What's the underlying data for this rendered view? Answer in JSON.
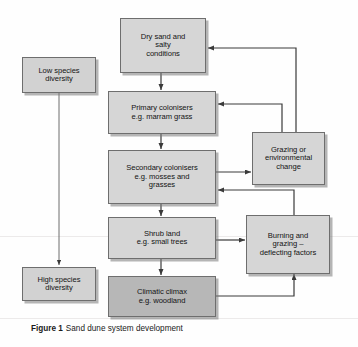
{
  "figure": {
    "caption_label": "Figure 1",
    "caption_text": "Sand dune system development",
    "colors": {
      "node_fill": "#d6d6d6",
      "node_fill_dark": "#b7b7b7",
      "node_border": "#6e6e6e",
      "arrow": "#3a3a3a",
      "background": "#fefefe"
    }
  },
  "nodes": {
    "dry_sand": "Dry sand and\nsalty\nconditions",
    "primary_colonisers": "Primary colonisers\ne.g. marram grass",
    "secondary_colonisers": "Secondary colonisers\ne.g. mosses and\ngrasses",
    "shrub_land": "Shrub land\ne.g. small trees",
    "climatic_climax": "Climatic climax\ne.g. woodland",
    "grazing_change": "Grazing or\nenvironmental\nchange",
    "burning_grazing": "Burning and\ngrazing –\ndeflecting factors",
    "low_diversity": "Low species\ndiversity",
    "high_diversity": "High species\ndiversity"
  },
  "diagram_data": {
    "type": "flowchart",
    "title": "Sand dune system development",
    "succession_chain": [
      "Dry sand and salty conditions",
      "Primary colonisers e.g. marram grass",
      "Secondary colonisers e.g. mosses and grasses",
      "Shrub land e.g. small trees",
      "Climatic climax e.g. woodland"
    ],
    "diversity_axis": {
      "top": "Low species diversity",
      "bottom": "High species diversity"
    },
    "deflecting_nodes": [
      "Grazing or environmental change",
      "Burning and grazing – deflecting factors"
    ],
    "edges": [
      {
        "from": "Dry sand and salty conditions",
        "to": "Primary colonisers e.g. marram grass",
        "style": "arrow-down"
      },
      {
        "from": "Primary colonisers e.g. marram grass",
        "to": "Secondary colonisers e.g. mosses and grasses",
        "style": "arrow-down"
      },
      {
        "from": "Secondary colonisers e.g. mosses and grasses",
        "to": "Shrub land e.g. small trees",
        "style": "arrow-down"
      },
      {
        "from": "Shrub land e.g. small trees",
        "to": "Climatic climax e.g. woodland",
        "style": "arrow-down"
      },
      {
        "from": "Secondary colonisers e.g. mosses and grasses",
        "to": "Grazing or environmental change",
        "style": "arrow-right"
      },
      {
        "from": "Grazing or environmental change",
        "to": "Primary colonisers e.g. marram grass",
        "style": "arrow-up-left"
      },
      {
        "from": "Grazing or environmental change",
        "to": "Dry sand and salty conditions",
        "style": "arrow-up-left"
      },
      {
        "from": "Shrub land e.g. small trees",
        "to": "Burning and grazing – deflecting factors",
        "style": "arrow-right"
      },
      {
        "from": "Burning and grazing – deflecting factors",
        "to": "Secondary colonisers e.g. mosses and grasses",
        "style": "arrow-up-left"
      },
      {
        "from": "Climatic climax e.g. woodland",
        "to": "Burning and grazing – deflecting factors",
        "style": "arrow-right-up"
      },
      {
        "from": "Low species diversity",
        "to": "High species diversity",
        "style": "arrow-down-thin"
      }
    ]
  }
}
